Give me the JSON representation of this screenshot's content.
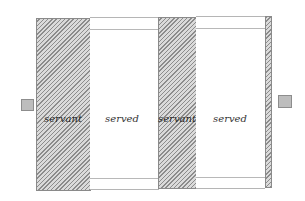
{
  "diagram": {
    "type": "servant-served space plan",
    "colors": {
      "hatch_fill": "#c9c9c9",
      "outline": "#8a8a8a",
      "served_fill": "#ffffff",
      "text": "#333333"
    },
    "bays": [
      {
        "kind": "servant",
        "label": "servant"
      },
      {
        "kind": "served",
        "label": "served"
      },
      {
        "kind": "servant",
        "label": "servant"
      },
      {
        "kind": "served",
        "label": "served"
      },
      {
        "kind": "servant-strip",
        "label": ""
      }
    ],
    "end_markers": [
      "left-square",
      "right-square"
    ]
  }
}
